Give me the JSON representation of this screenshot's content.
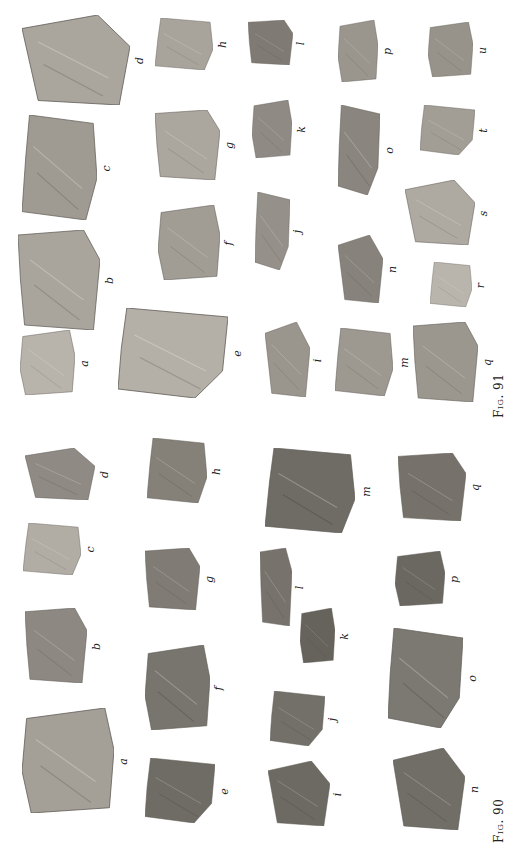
{
  "page": {
    "orientation": "rotated-90-ccw",
    "background": "#ffffff"
  },
  "figures": [
    {
      "id": "fig-91",
      "caption": "Fig. 91",
      "description": "Incised pottery sherds",
      "sherds": [
        {
          "label": "a",
          "x": 20,
          "y": 330,
          "w": 55,
          "h": 65,
          "tone": "#b8b4ac"
        },
        {
          "label": "b",
          "x": 18,
          "y": 230,
          "w": 82,
          "h": 100,
          "tone": "#a9a59d"
        },
        {
          "label": "c",
          "x": 22,
          "y": 115,
          "w": 75,
          "h": 105,
          "tone": "#9f9b93"
        },
        {
          "label": "d",
          "x": 22,
          "y": 15,
          "w": 108,
          "h": 90,
          "tone": "#aaa69e"
        },
        {
          "label": "e",
          "x": 118,
          "y": 308,
          "w": 110,
          "h": 90,
          "tone": "#b4b0a8"
        },
        {
          "label": "f",
          "x": 158,
          "y": 205,
          "w": 62,
          "h": 75,
          "tone": "#a19d95"
        },
        {
          "label": "g",
          "x": 155,
          "y": 110,
          "w": 65,
          "h": 70,
          "tone": "#aba79f"
        },
        {
          "label": "h",
          "x": 155,
          "y": 18,
          "w": 58,
          "h": 52,
          "tone": "#a8a49c"
        },
        {
          "label": "i",
          "x": 265,
          "y": 322,
          "w": 45,
          "h": 75,
          "tone": "#9a968e"
        },
        {
          "label": "j",
          "x": 255,
          "y": 192,
          "w": 35,
          "h": 78,
          "tone": "#95918a"
        },
        {
          "label": "k",
          "x": 252,
          "y": 100,
          "w": 40,
          "h": 58,
          "tone": "#8f8b84"
        },
        {
          "label": "l",
          "x": 248,
          "y": 20,
          "w": 45,
          "h": 45,
          "tone": "#7f7b74"
        },
        {
          "label": "m",
          "x": 335,
          "y": 328,
          "w": 58,
          "h": 68,
          "tone": "#9d9991"
        },
        {
          "label": "n",
          "x": 338,
          "y": 235,
          "w": 45,
          "h": 68,
          "tone": "#87837c"
        },
        {
          "label": "o",
          "x": 338,
          "y": 105,
          "w": 42,
          "h": 90,
          "tone": "#8a867f"
        },
        {
          "label": "p",
          "x": 338,
          "y": 20,
          "w": 40,
          "h": 62,
          "tone": "#9a968e"
        },
        {
          "label": "q",
          "x": 413,
          "y": 322,
          "w": 65,
          "h": 80,
          "tone": "#9b978f"
        },
        {
          "label": "r",
          "x": 430,
          "y": 262,
          "w": 42,
          "h": 45,
          "tone": "#b9b5ad"
        },
        {
          "label": "s",
          "x": 405,
          "y": 180,
          "w": 70,
          "h": 65,
          "tone": "#aeaaa2"
        },
        {
          "label": "t",
          "x": 420,
          "y": 105,
          "w": 55,
          "h": 50,
          "tone": "#a29e96"
        },
        {
          "label": "u",
          "x": 428,
          "y": 22,
          "w": 45,
          "h": 55,
          "tone": "#97938b"
        }
      ]
    },
    {
      "id": "fig-90",
      "caption": "Fig. 90",
      "description": "Painted and plain pottery sherds",
      "sherds": [
        {
          "label": "a",
          "x": 22,
          "y": 285,
          "w": 92,
          "h": 105,
          "tone": "#a4a098"
        },
        {
          "label": "b",
          "x": 25,
          "y": 185,
          "w": 62,
          "h": 75,
          "tone": "#8d8982"
        },
        {
          "label": "c",
          "x": 23,
          "y": 100,
          "w": 58,
          "h": 52,
          "tone": "#b1ada5"
        },
        {
          "label": "d",
          "x": 25,
          "y": 25,
          "w": 70,
          "h": 52,
          "tone": "#8f8b84"
        },
        {
          "label": "e",
          "x": 145,
          "y": 335,
          "w": 70,
          "h": 65,
          "tone": "#6f6b65"
        },
        {
          "label": "f",
          "x": 145,
          "y": 222,
          "w": 65,
          "h": 85,
          "tone": "#78746e"
        },
        {
          "label": "g",
          "x": 145,
          "y": 125,
          "w": 55,
          "h": 62,
          "tone": "#807c75"
        },
        {
          "label": "h",
          "x": 147,
          "y": 15,
          "w": 60,
          "h": 65,
          "tone": "#858179"
        },
        {
          "label": "i",
          "x": 268,
          "y": 338,
          "w": 62,
          "h": 65,
          "tone": "#6d6963"
        },
        {
          "label": "j",
          "x": 270,
          "y": 268,
          "w": 55,
          "h": 55,
          "tone": "#736f69"
        },
        {
          "label": "k",
          "x": 300,
          "y": 185,
          "w": 35,
          "h": 55,
          "tone": "#66625c"
        },
        {
          "label": "l",
          "x": 260,
          "y": 125,
          "w": 32,
          "h": 78,
          "tone": "#77736c"
        },
        {
          "label": "m",
          "x": 265,
          "y": 25,
          "w": 90,
          "h": 85,
          "tone": "#6f6b65"
        },
        {
          "label": "n",
          "x": 393,
          "y": 325,
          "w": 72,
          "h": 82,
          "tone": "#716d67"
        },
        {
          "label": "o",
          "x": 388,
          "y": 205,
          "w": 75,
          "h": 100,
          "tone": "#7c7872"
        },
        {
          "label": "p",
          "x": 395,
          "y": 128,
          "w": 50,
          "h": 55,
          "tone": "#6b6761"
        },
        {
          "label": "q",
          "x": 398,
          "y": 30,
          "w": 68,
          "h": 68,
          "tone": "#76726b"
        }
      ]
    }
  ]
}
